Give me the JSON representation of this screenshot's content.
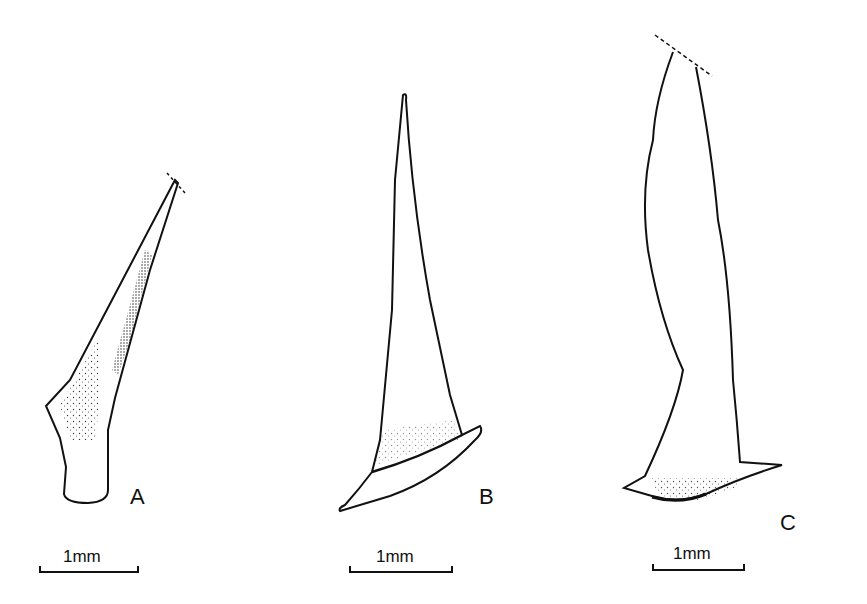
{
  "figure": {
    "panels": [
      {
        "id": "A",
        "label": "A",
        "scale_bar": "1mm"
      },
      {
        "id": "B",
        "label": "B",
        "scale_bar": "1mm"
      },
      {
        "id": "C",
        "label": "C",
        "scale_bar": "1mm"
      }
    ],
    "colors": {
      "ink": "#111111",
      "background": "#ffffff"
    }
  }
}
